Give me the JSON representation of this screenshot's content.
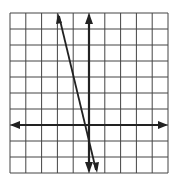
{
  "chart_data": {
    "type": "line",
    "title": "",
    "xlabel": "",
    "ylabel": "",
    "grid": true,
    "xlim": [
      -5,
      5
    ],
    "ylim": [
      -3,
      7
    ],
    "series": [
      {
        "name": "line",
        "x": [
          -2,
          0.5
        ],
        "y": [
          7,
          -3
        ],
        "slope": -4,
        "y_intercept": -1
      }
    ]
  },
  "colors": {
    "grid": "#333333",
    "axes": "#222222",
    "line": "#222222"
  }
}
